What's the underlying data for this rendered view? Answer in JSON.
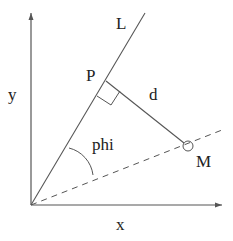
{
  "diagram": {
    "type": "geometry",
    "labels": {
      "line": "L",
      "point_p": "P",
      "distance": "d",
      "angle": "phi",
      "point_m": "M",
      "x_axis": "x",
      "y_axis": "y"
    },
    "colors": {
      "stroke": "#444444",
      "text": "#222222",
      "background": "#ffffff"
    },
    "elements": [
      {
        "name": "x-axis",
        "kind": "arrow",
        "from": [
          31,
          205
        ],
        "to": [
          222,
          205
        ]
      },
      {
        "name": "y-axis",
        "kind": "arrow",
        "from": [
          31,
          205
        ],
        "to": [
          31,
          13
        ]
      },
      {
        "name": "line-L",
        "kind": "line",
        "from": [
          31,
          205
        ],
        "to": [
          145,
          13
        ]
      },
      {
        "name": "perpendicular-d",
        "kind": "line",
        "from": [
          106,
          81
        ],
        "to": [
          188,
          146
        ]
      },
      {
        "name": "dashed-line-OM",
        "kind": "dashed-line",
        "from": [
          31,
          205
        ],
        "to": [
          222,
          130
        ]
      },
      {
        "name": "point-M",
        "kind": "circle",
        "center": [
          188,
          146
        ],
        "r": 5
      },
      {
        "name": "right-angle-marker",
        "kind": "polyline"
      },
      {
        "name": "angle-phi-arc",
        "kind": "arc"
      }
    ]
  }
}
